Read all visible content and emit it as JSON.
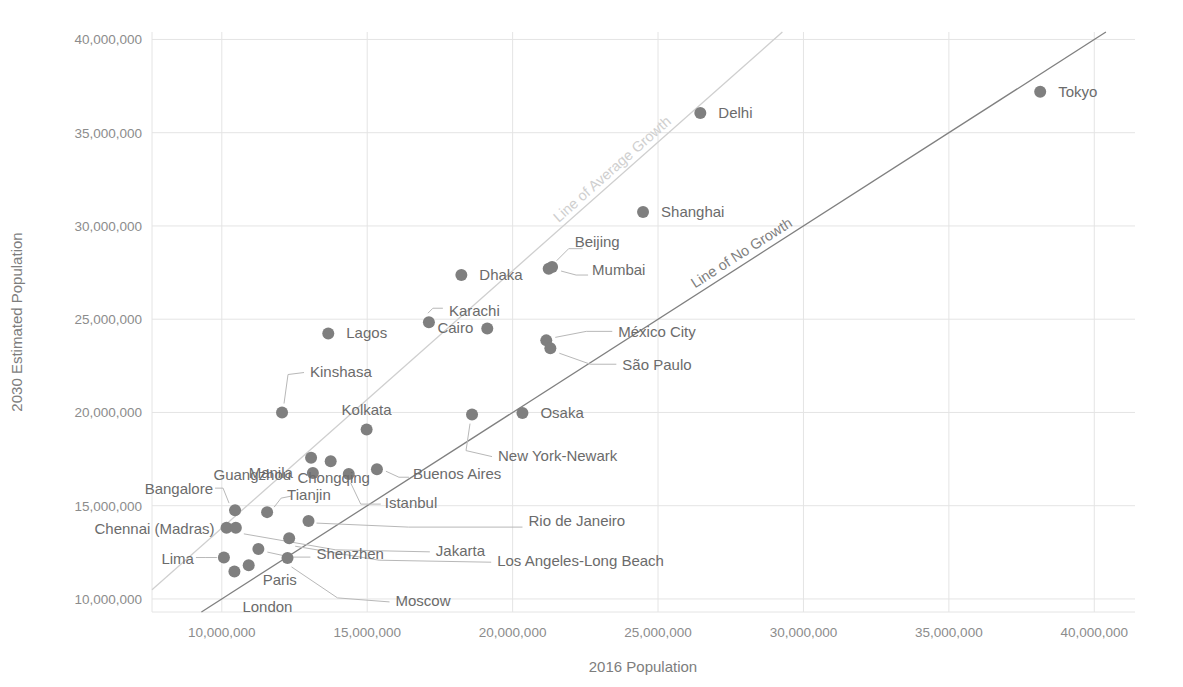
{
  "chart_data": {
    "type": "scatter",
    "title": "",
    "xlabel": "2016 Population",
    "ylabel": "2030 Estimated Population",
    "xlim": [
      7600000,
      41400000
    ],
    "ylim": [
      9300000,
      40400000
    ],
    "xticks": [
      "10,000,000",
      "15,000,000",
      "20,000,000",
      "25,000,000",
      "30,000,000",
      "35,000,000",
      "40,000,000"
    ],
    "xtick_values": [
      10000000,
      15000000,
      20000000,
      25000000,
      30000000,
      35000000,
      40000000
    ],
    "yticks": [
      "10,000,000",
      "15,000,000",
      "20,000,000",
      "25,000,000",
      "30,000,000",
      "35,000,000",
      "40,000,000"
    ],
    "ytick_values": [
      10000000,
      15000000,
      20000000,
      25000000,
      30000000,
      35000000,
      40000000
    ],
    "grid": true,
    "legend": "none",
    "point_color": "#7f7f7f",
    "reference_lines": [
      {
        "name": "Line of No Growth",
        "label": "Line of No Growth",
        "color": "#808080",
        "slope": 1.0,
        "intercept": 0
      },
      {
        "name": "Line of Average Growth",
        "label": "Line of Average Growth",
        "color": "#cfcfcf",
        "slope": 1.38,
        "intercept": 0
      }
    ],
    "points": [
      {
        "name": "Tokyo",
        "x": 38140000,
        "y": 37190000,
        "label_side": "right"
      },
      {
        "name": "Delhi",
        "x": 26454000,
        "y": 36060000,
        "label_side": "right"
      },
      {
        "name": "Shanghai",
        "x": 24484000,
        "y": 30750000,
        "label_side": "right"
      },
      {
        "name": "Beijing",
        "x": 21240000,
        "y": 27710000,
        "label_side": "leader-up"
      },
      {
        "name": "Mumbai",
        "x": 21357000,
        "y": 27797000,
        "label_side": "leader-right"
      },
      {
        "name": "Dhaka",
        "x": 18237000,
        "y": 27374000,
        "label_side": "right"
      },
      {
        "name": "Karachi",
        "x": 17121000,
        "y": 24838000,
        "label_side": "leader-right"
      },
      {
        "name": "Cairo",
        "x": 19128000,
        "y": 24502000,
        "label_side": "right"
      },
      {
        "name": "México City",
        "x": 21157000,
        "y": 23865000,
        "label_side": "leader-right"
      },
      {
        "name": "São Paulo",
        "x": 21297000,
        "y": 23444000,
        "label_side": "leader-right"
      },
      {
        "name": "Lagos",
        "x": 13661000,
        "y": 24239000,
        "label_side": "right"
      },
      {
        "name": "Kinshasa",
        "x": 12071000,
        "y": 19996000,
        "label_side": "leader-up"
      },
      {
        "name": "Kolkata",
        "x": 14980000,
        "y": 19092000,
        "label_side": "above"
      },
      {
        "name": "Osaka",
        "x": 20337000,
        "y": 19976000,
        "label_side": "right"
      },
      {
        "name": "New York-Newark",
        "x": 18604000,
        "y": 19885000,
        "label_side": "leader-down"
      },
      {
        "name": "Guangzhou",
        "x": 13070000,
        "y": 17574000,
        "label_side": "left"
      },
      {
        "name": "Chongqing",
        "x": 13744000,
        "y": 17380000,
        "label_side": "below"
      },
      {
        "name": "Buenos Aires",
        "x": 15334000,
        "y": 16956000,
        "label_side": "leader-right"
      },
      {
        "name": "Manila",
        "x": 13131000,
        "y": 16756000,
        "label_side": "left"
      },
      {
        "name": "Istanbul",
        "x": 14365000,
        "y": 16694000,
        "label_side": "leader-down"
      },
      {
        "name": "Bangalore",
        "x": 10456000,
        "y": 14762000,
        "label_side": "leader-left"
      },
      {
        "name": "Tianjin",
        "x": 11558000,
        "y": 14655000,
        "label_side": "leader-right"
      },
      {
        "name": "Chennai (Madras)",
        "x": 10163000,
        "y": 13814000,
        "label_side": "left"
      },
      {
        "name": "Rio de Janeiro",
        "x": 12981000,
        "y": 14174000,
        "label_side": "leader-right"
      },
      {
        "name": "Jakarta",
        "x": 10483000,
        "y": 13812000,
        "label_side": "leader-right"
      },
      {
        "name": "Lima",
        "x": 10072000,
        "y": 12221000,
        "label_side": "leader-left"
      },
      {
        "name": "Shenzhen",
        "x": 11258000,
        "y": 12673000,
        "label_side": "leader-right"
      },
      {
        "name": "Los Angeles-Long Beach",
        "x": 12317000,
        "y": 13257000,
        "label_side": "leader-right"
      },
      {
        "name": "Paris",
        "x": 10925000,
        "y": 11803000,
        "label_side": "below"
      },
      {
        "name": "London",
        "x": 10434000,
        "y": 11467000,
        "label_side": "below"
      },
      {
        "name": "Moscow",
        "x": 12260000,
        "y": 12200000,
        "label_side": "leader-right"
      }
    ]
  },
  "axes": {
    "x_title": "2016 Population",
    "y_title": "2030 Estimated Population"
  }
}
